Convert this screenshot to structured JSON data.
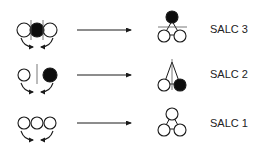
{
  "diagram": {
    "colors": {
      "stroke": "#1a1a1a",
      "filled": "#0d0d0d",
      "open": "#ffffff",
      "text": "#222222"
    },
    "rows": [
      {
        "id": "salc3",
        "label": "SALC 3",
        "linear_pattern": [
          "open",
          "filled",
          "open"
        ],
        "divider": "double-vertical",
        "triangle_top": "filled",
        "triangle_left": "open",
        "triangle_right": "open",
        "triangle_node": "horizontal"
      },
      {
        "id": "salc2",
        "label": "SALC 2",
        "linear_pattern": [
          "open",
          "none",
          "filled"
        ],
        "divider": "single-vertical",
        "triangle_top": "none",
        "triangle_left": "open",
        "triangle_right": "filled",
        "triangle_node": "vertical"
      },
      {
        "id": "salc1",
        "label": "SALC 1",
        "linear_pattern": [
          "open",
          "open",
          "open"
        ],
        "divider": "none",
        "triangle_top": "open",
        "triangle_left": "open",
        "triangle_right": "open",
        "triangle_node": "none"
      }
    ]
  }
}
